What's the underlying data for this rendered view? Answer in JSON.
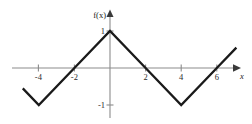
{
  "figure": {
    "width": 252,
    "height": 124,
    "background": "#ffffff",
    "axis_color": "#8b8b8b",
    "curve_color": "#1a1a1a",
    "text_color": "#1a1a1a"
  },
  "labels": {
    "function_label": "f(x)",
    "x_axis_label": "x",
    "y_tick_1": "1",
    "y_tick_neg1": "-1",
    "x_tick_neg4": "-4",
    "x_tick_neg2": "-2",
    "x_tick_2": "2",
    "x_tick_4": "4",
    "x_tick_6": "6"
  },
  "chart_data": {
    "type": "line",
    "title": "",
    "xlabel": "x",
    "ylabel": "f(x)",
    "xlim": [
      -5,
      8
    ],
    "ylim": [
      -1.5,
      1.4
    ],
    "grid": false,
    "legend": false,
    "series": [
      {
        "name": "f(x)",
        "x": [
          -4.9,
          -4,
          -2,
          0,
          2,
          4,
          6,
          7.1
        ],
        "y": [
          -0.55,
          -1,
          0,
          1,
          0,
          -1,
          0,
          0.55
        ]
      }
    ],
    "x_ticks": [
      -4,
      -2,
      2,
      4,
      6
    ],
    "x_tick_labels": [
      "-4",
      "-2",
      "2",
      "4",
      "6"
    ],
    "y_ticks": [
      1,
      -1
    ],
    "y_tick_labels": [
      "1",
      "-1"
    ],
    "annotations": []
  },
  "geometry": {
    "origin_px": [
      110,
      68
    ],
    "x_unit_px": 17.8,
    "y_unit_px": 37
  }
}
